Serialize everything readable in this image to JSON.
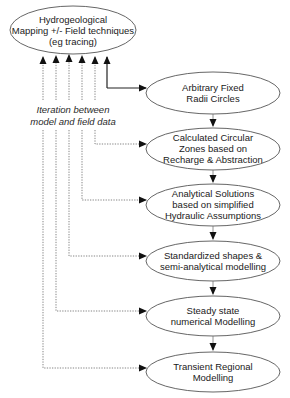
{
  "top_node": {
    "lines": [
      "Hydrogeological",
      "Mapping +/- Field techniques",
      "(eg tracing)"
    ]
  },
  "iteration_label": {
    "lines": [
      "Iteration between",
      "model and field data"
    ]
  },
  "chain": [
    {
      "lines": [
        "Arbitrary Fixed",
        "Radii Circles"
      ]
    },
    {
      "lines": [
        "Calculated Circular",
        "Zones based on",
        "Recharge & Abstraction"
      ]
    },
    {
      "lines": [
        "Analytical Solutions",
        "based on simplified",
        "Hydraulic Assumptions"
      ]
    },
    {
      "lines": [
        "Standardized shapes  &",
        "semi-analytical modelling"
      ]
    },
    {
      "lines": [
        "Steady  state",
        "numerical Modelling"
      ]
    },
    {
      "lines": [
        "Transient Regional",
        "Modelling"
      ]
    }
  ],
  "colors": {
    "stroke": "#333333",
    "dotted": "#666666",
    "text": "#1a1a1a"
  }
}
